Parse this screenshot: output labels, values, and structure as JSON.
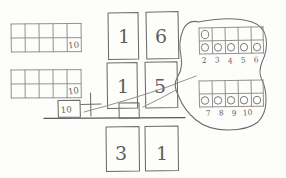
{
  "page": {
    "medium": "pencil on paper",
    "ink_color": "#6e6c6a",
    "paper_color": "#fdfdfc"
  },
  "problem": {
    "addend_top": "16",
    "addend_bottom": "15",
    "operator": "+",
    "sum": "31",
    "carry_box_value": "",
    "regroup_note": "10"
  },
  "digit_boxes": {
    "top_row": [
      {
        "name": "tens",
        "value": "1"
      },
      {
        "name": "ones",
        "value": "6"
      }
    ],
    "middle_row": [
      {
        "name": "tens",
        "value": "1"
      },
      {
        "name": "ones",
        "value": "5"
      }
    ],
    "answer_row": [
      {
        "name": "tens",
        "value": "3"
      },
      {
        "name": "ones",
        "value": "1"
      }
    ]
  },
  "ten_frames_left": [
    {
      "name": "first-ten-frame",
      "label": "10",
      "columns": 5,
      "rows": 2
    },
    {
      "name": "second-ten-frame",
      "label": "10",
      "columns": 5,
      "rows": 2
    }
  ],
  "regroup_box": {
    "value": "10"
  },
  "counting_groups": {
    "upper": {
      "label_sequence": [
        "2",
        "3",
        "4",
        "5",
        "6"
      ],
      "counters_top_row": 1,
      "counters_bottom_row": 5,
      "columns": 5,
      "rows": 2
    },
    "lower": {
      "label_sequence": [
        "7",
        "8",
        "9",
        "10"
      ],
      "counters_bottom_row": 5,
      "columns": 5,
      "rows": 2
    }
  },
  "annotations": {
    "loop_description": "hand-drawn loop enclosing both counting ten-frames",
    "connector_description": "curved line from ones digit to counting groups",
    "addition_line": "horizontal rule under the addends"
  }
}
